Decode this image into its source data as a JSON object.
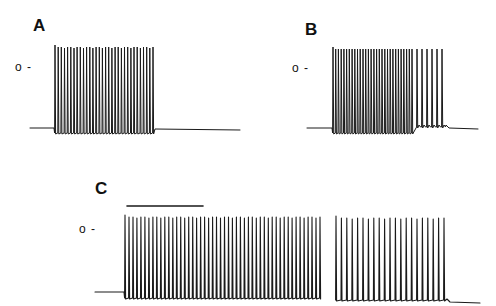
{
  "chart_data": {
    "type": "line",
    "title": "",
    "panels": [
      {
        "label": "A",
        "zero_marker": "o -",
        "baseline_y": 128,
        "trace_start_x": 30,
        "trace_end_x": 240,
        "burst": {
          "start_x": 55,
          "end_x": 153,
          "spike_count": 32,
          "peak_y": 47,
          "trough_y": 133
        },
        "post_baseline_y": 129,
        "afterpotential": false
      },
      {
        "label": "B",
        "zero_marker": "o -",
        "baseline_y": 128,
        "trace_start_x": 307,
        "trace_end_x": 478,
        "burst": {
          "start_x": 333,
          "end_x": 442,
          "spike_count": 36,
          "peak_y": 49,
          "trough_y": 133,
          "late_sparse_spikes": 6,
          "late_start_x": 412
        },
        "post_baseline_y": 128,
        "afterpotential": true
      },
      {
        "label": "C",
        "zero_marker": "o -",
        "scale_bar": {
          "x1": 127,
          "x2": 203,
          "y": 206
        },
        "baseline_y": 292,
        "trace_start_x": 95,
        "trace_end_x": 480,
        "segments": [
          {
            "start_x": 125,
            "end_x": 320,
            "spike_count": 50,
            "peak_y": 217,
            "trough_y": 298
          },
          {
            "start_x": 336,
            "end_x": 444,
            "spike_count": 21,
            "peak_y": 218,
            "trough_y": 300
          }
        ],
        "post_baseline_y": 302,
        "afterpotential": true
      }
    ],
    "xlabel": "",
    "ylabel": "",
    "legend": []
  },
  "labels": {
    "panel_a": "A",
    "panel_b": "B",
    "panel_c": "C",
    "zero_a": "o -",
    "zero_b": "o -",
    "zero_c": "o -"
  },
  "colors": {
    "trace": "#1a1a1a",
    "background": "#ffffff"
  }
}
